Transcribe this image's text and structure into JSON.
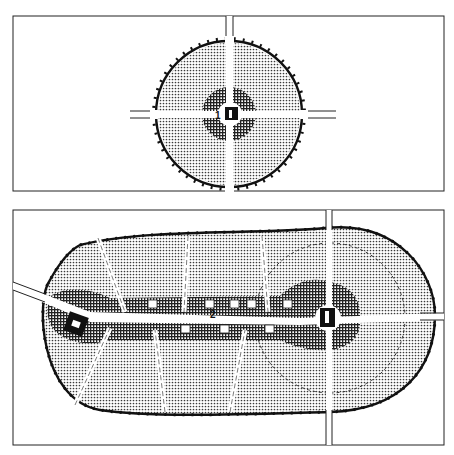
{
  "diagram": {
    "panels": [
      {
        "id": "panel-top",
        "description": "Circular town plan with central core, four radial roads and green belt",
        "labels": [
          {
            "text": "1"
          }
        ]
      },
      {
        "id": "panel-bottom",
        "description": "Elongated (linear) town plan with two cores connected by a central spine",
        "labels": [
          {
            "text": "2"
          }
        ]
      }
    ],
    "legend_patterns": {
      "residential": "fine-dot-stipple",
      "center_zone": "dense-crosshatch",
      "core": "solid-black-block",
      "boundary": "thick-line-with-ticks"
    },
    "colors": {
      "ink": "#111111",
      "paper": "#ffffff",
      "stipple": "#555555"
    }
  }
}
